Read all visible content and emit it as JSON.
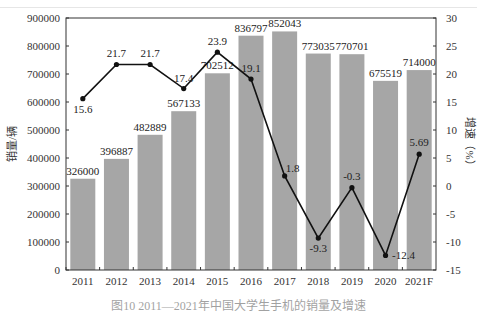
{
  "chart_data": {
    "type": "bar+line",
    "title": "",
    "categories": [
      "2011",
      "2012",
      "2013",
      "2014",
      "2015",
      "2016",
      "2017",
      "2018",
      "2019",
      "2020",
      "2021F"
    ],
    "series": [
      {
        "name": "销量",
        "type": "bar",
        "axis": "left",
        "color": "#a6a6a6",
        "values": [
          326000,
          396887,
          482889,
          567133,
          702512,
          836797,
          852043,
          773035,
          770701,
          675519,
          714000
        ],
        "labels": [
          "326000",
          "396887",
          "482889",
          "567133",
          "702512",
          "836797",
          "852043",
          "773035",
          "770701",
          "675519",
          "714000"
        ]
      },
      {
        "name": "增速",
        "type": "line",
        "axis": "right",
        "color": "#111111",
        "values": [
          15.6,
          21.7,
          21.7,
          17.4,
          23.9,
          19.1,
          1.8,
          -9.3,
          -0.3,
          -12.4,
          5.69
        ],
        "labels": [
          "15.6",
          "21.7",
          "21.7",
          "17.4",
          "23.9",
          "19.1",
          "1.8",
          "-9.3",
          "-0.3",
          "-12.4",
          "5.69"
        ]
      }
    ],
    "ylabel": "销量/辆",
    "ylabel_right": "增速（%）",
    "xlabel": "",
    "ylim": [
      0,
      900000
    ],
    "ylim_right": [
      -15,
      30
    ],
    "yticks": [
      "0",
      "100000",
      "200000",
      "300000",
      "400000",
      "500000",
      "600000",
      "700000",
      "800000",
      "900000"
    ],
    "yticks_right": [
      "-15",
      "-10",
      "-5",
      "0",
      "5",
      "10",
      "15",
      "20",
      "25",
      "30"
    ],
    "grid": false,
    "legend": "none"
  },
  "caption": "图10  2011—2021年中国大学生手机的销量及增速"
}
